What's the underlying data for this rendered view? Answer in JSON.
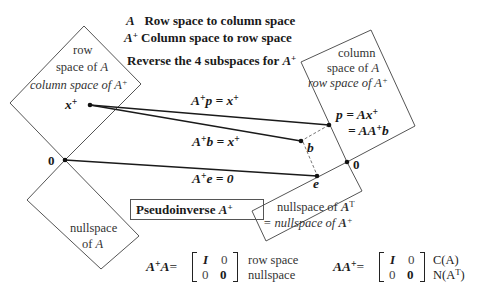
{
  "header": {
    "line1_sym": "A",
    "line1_text": "Row space to column space",
    "line2_sym": "A",
    "line2_sup": "+",
    "line2_text": "Column space to row space",
    "line3_text": "Reverse the 4 subspaces for",
    "line3_sym": "A",
    "line3_sup": "+"
  },
  "left_upper_region": {
    "line1": "row",
    "line2": "space of",
    "line2_sym": "A",
    "line3": "column space of",
    "line3_sym": "A",
    "line3_sup": "+",
    "point_label": "x",
    "point_sup": "+"
  },
  "left_lower_region": {
    "line1": "nullspace",
    "line2": "of",
    "line2_sym": "A",
    "origin_label": "0"
  },
  "right_upper_region": {
    "line1": "column",
    "line2": "space of",
    "line2_sym": "A",
    "line3": "row space of",
    "line3_sym": "A",
    "line3_sup": "+",
    "p_eq1": "p = Ax",
    "p_eq1_sup": "+",
    "p_eq2": "= AA",
    "p_eq2_sup": "+",
    "p_eq2_tail": "b"
  },
  "right_lower_region": {
    "line1": "nullspace of",
    "line1_sym": "A",
    "line1_sup": "T",
    "line2": "= nullspace of",
    "line2_sym": "A",
    "line2_sup": "+",
    "origin_label": "0",
    "e_label": "e",
    "b_label": "b"
  },
  "arrows": {
    "p_map": {
      "lhs": "A",
      "sup": "+",
      "rest": "p = x",
      "rest_sup": "+"
    },
    "b_map": {
      "lhs": "A",
      "sup": "+",
      "rest": "b = x",
      "rest_sup": "+"
    },
    "e_map": {
      "lhs": "A",
      "sup": "+",
      "rest": "e = 0"
    }
  },
  "title_box": {
    "text": "Pseudoinverse",
    "sym": "A",
    "sup": "+"
  },
  "formulas": {
    "left": {
      "lhs": "A",
      "lhs_sup": "+",
      "lhs_tail": "A",
      "eq": "=",
      "matrix": [
        [
          "I",
          "0"
        ],
        [
          "0",
          "0"
        ]
      ],
      "labels": [
        "row space",
        "nullspace"
      ]
    },
    "right": {
      "lhs": "AA",
      "lhs_sup": "+",
      "eq": "=",
      "matrix": [
        [
          "I",
          "0"
        ],
        [
          "0",
          "0"
        ]
      ],
      "labels": [
        "C(A)",
        "N(A"
      ],
      "label2_sup": "T",
      "label2_tail": ")"
    }
  },
  "colors": {
    "line": "#555555",
    "arrow": "#1a1a1a",
    "dashed": "#777777",
    "background": "#ffffff"
  }
}
